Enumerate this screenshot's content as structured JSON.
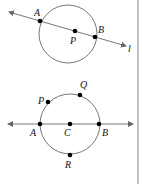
{
  "figure1": {
    "labels": {
      "A": "A",
      "B": "B",
      "P": "P",
      "line": "l"
    }
  },
  "figure2": {
    "labels": {
      "P": "P",
      "Q": "Q",
      "A": "A",
      "C": "C",
      "B": "B",
      "R": "R"
    }
  },
  "colors": {
    "circle": "#777777",
    "line": "#777777",
    "point": "#000000",
    "border": "#888888"
  }
}
